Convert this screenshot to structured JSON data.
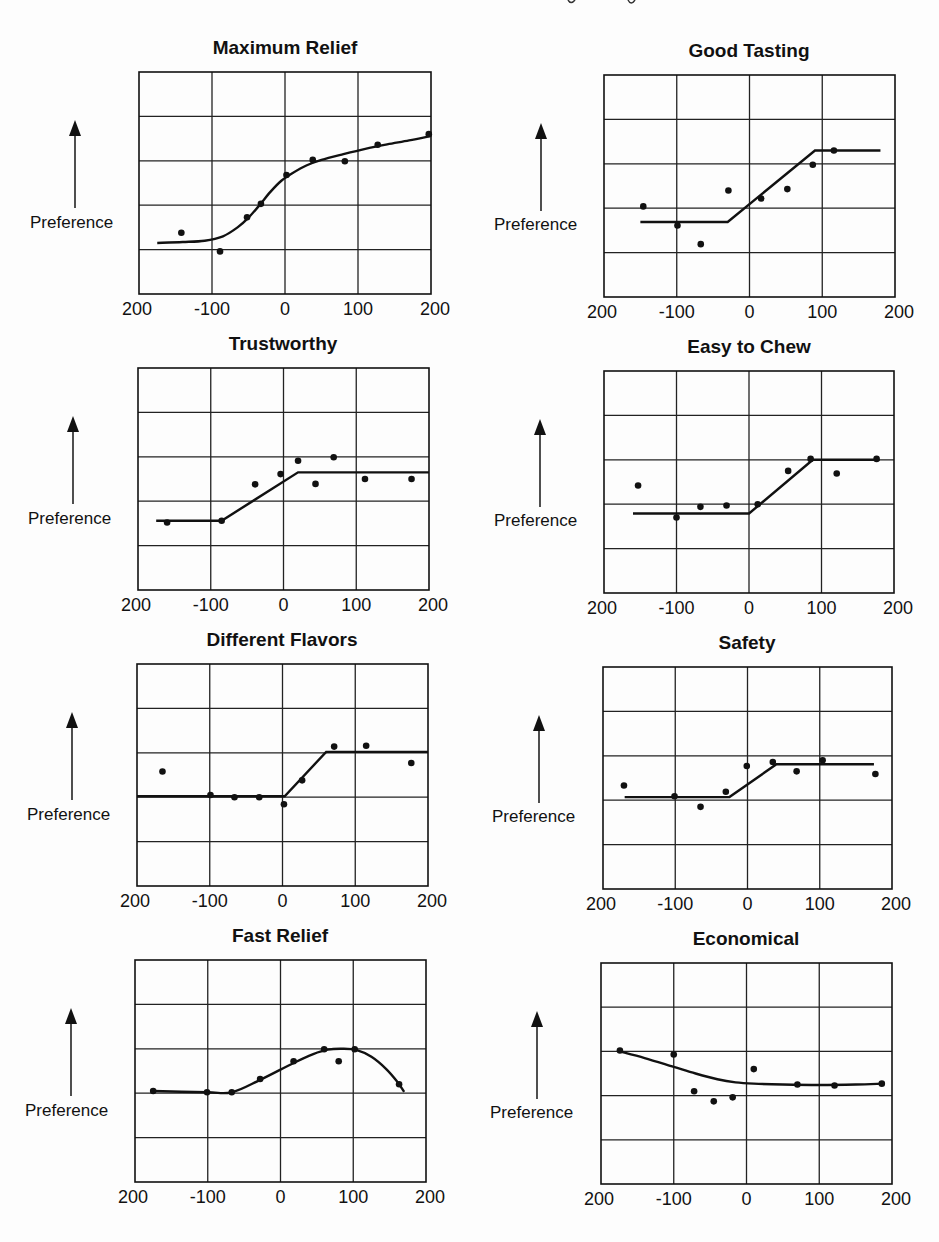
{
  "figure": {
    "y_axis_label": "Preference",
    "x_tick_labels": [
      "200",
      "-100",
      "0",
      "100",
      "200"
    ]
  },
  "chart_data": [
    {
      "type": "scatter",
      "title": "Maximum Relief",
      "xlabel": "",
      "ylabel": "Preference",
      "xlim": [
        -200,
        200
      ],
      "ylim": [
        0,
        5
      ],
      "x_ticks": [
        -200,
        -100,
        0,
        100,
        200
      ],
      "x_tick_labels": [
        "200",
        "-100",
        "0",
        "100",
        "200"
      ],
      "grid": true,
      "points": {
        "x": [
          -142,
          -89,
          -52,
          -33,
          2,
          38,
          82,
          127,
          197
        ],
        "y": [
          1.38,
          0.96,
          1.73,
          2.03,
          2.68,
          3.02,
          2.99,
          3.36,
          3.6
        ]
      },
      "fit": {
        "kind": "curve",
        "x": [
          -175,
          -140,
          -110,
          -85,
          -65,
          -50,
          -35,
          -20,
          -5,
          10,
          30,
          50,
          80,
          110,
          140,
          170,
          200
        ],
        "y": [
          1.15,
          1.17,
          1.2,
          1.3,
          1.5,
          1.72,
          2.0,
          2.3,
          2.55,
          2.72,
          2.9,
          3.02,
          3.15,
          3.27,
          3.37,
          3.46,
          3.56
        ]
      }
    },
    {
      "type": "scatter",
      "title": "Good Tasting",
      "xlabel": "",
      "ylabel": "Preference",
      "xlim": [
        -200,
        200
      ],
      "ylim": [
        0,
        5
      ],
      "x_ticks": [
        -200,
        -100,
        0,
        100,
        200
      ],
      "x_tick_labels": [
        "200",
        "-100",
        "0",
        "100",
        "200"
      ],
      "grid": true,
      "points": {
        "x": [
          -146,
          -99,
          -67,
          -29,
          16,
          52,
          87,
          116
        ],
        "y": [
          2.04,
          1.61,
          1.19,
          2.4,
          2.22,
          2.43,
          2.98,
          3.3
        ]
      },
      "fit": {
        "kind": "piecewise",
        "x": [
          -150,
          -30,
          90,
          180
        ],
        "y": [
          1.69,
          1.69,
          3.3,
          3.3
        ]
      }
    },
    {
      "type": "scatter",
      "title": "Trustworthy",
      "xlabel": "",
      "ylabel": "Preference",
      "xlim": [
        -200,
        200
      ],
      "ylim": [
        0,
        5
      ],
      "x_ticks": [
        -200,
        -100,
        0,
        100,
        200
      ],
      "x_tick_labels": [
        "200",
        "-100",
        "0",
        "100",
        "200"
      ],
      "grid": true,
      "points": {
        "x": [
          -160,
          -85,
          -39,
          -4,
          20,
          44,
          69,
          112,
          176
        ],
        "y": [
          1.52,
          1.56,
          2.38,
          2.61,
          2.91,
          2.39,
          2.99,
          2.5,
          2.5
        ]
      },
      "fit": {
        "kind": "piecewise",
        "x": [
          -175,
          -85,
          20,
          200
        ],
        "y": [
          1.56,
          1.56,
          2.65,
          2.65
        ]
      }
    },
    {
      "type": "scatter",
      "title": "Easy to Chew",
      "xlabel": "",
      "ylabel": "Preference",
      "xlim": [
        -200,
        200
      ],
      "ylim": [
        0,
        5
      ],
      "x_ticks": [
        -200,
        -100,
        0,
        100,
        200
      ],
      "x_tick_labels": [
        "200",
        "-100",
        "0",
        "100",
        "200"
      ],
      "grid": true,
      "points": {
        "x": [
          -153,
          -100,
          -67,
          -31,
          12,
          54,
          85,
          121,
          176
        ],
        "y": [
          2.42,
          1.7,
          1.94,
          1.97,
          2.0,
          2.75,
          3.02,
          2.69,
          3.02
        ]
      },
      "fit": {
        "kind": "piecewise",
        "x": [
          -160,
          0,
          88,
          180
        ],
        "y": [
          1.79,
          1.79,
          3.0,
          3.0
        ]
      }
    },
    {
      "type": "scatter",
      "title": "Different Flavors",
      "xlabel": "",
      "ylabel": "Preference",
      "xlim": [
        -200,
        200
      ],
      "ylim": [
        0,
        5
      ],
      "x_ticks": [
        -200,
        -100,
        0,
        100,
        200
      ],
      "x_tick_labels": [
        "200",
        "-100",
        "0",
        "100",
        "200"
      ],
      "grid": true,
      "points": {
        "x": [
          -165,
          -99,
          -66,
          -32,
          2,
          27,
          71,
          115,
          177
        ],
        "y": [
          2.58,
          2.05,
          2.0,
          2.0,
          1.84,
          2.38,
          3.14,
          3.16,
          2.77
        ]
      },
      "fit": {
        "kind": "piecewise",
        "x": [
          -200,
          3,
          60,
          200
        ],
        "y": [
          2.02,
          2.02,
          3.02,
          3.02
        ]
      }
    },
    {
      "type": "scatter",
      "title": "Safety",
      "xlabel": "",
      "ylabel": "Preference",
      "xlim": [
        -200,
        200
      ],
      "ylim": [
        0,
        5
      ],
      "x_ticks": [
        -200,
        -100,
        0,
        100,
        200
      ],
      "x_tick_labels": [
        "200",
        "-100",
        "0",
        "100",
        "200"
      ],
      "grid": true,
      "points": {
        "x": [
          -171,
          -101,
          -65,
          -30,
          -1,
          35,
          68,
          104,
          177
        ],
        "y": [
          2.33,
          2.09,
          1.85,
          2.19,
          2.77,
          2.86,
          2.65,
          2.9,
          2.59
        ]
      },
      "fit": {
        "kind": "piecewise",
        "x": [
          -170,
          -25,
          40,
          175
        ],
        "y": [
          2.07,
          2.07,
          2.81,
          2.81
        ]
      }
    },
    {
      "type": "scatter",
      "title": "Fast Relief",
      "xlabel": "",
      "ylabel": "Preference",
      "xlim": [
        -200,
        200
      ],
      "ylim": [
        0,
        5
      ],
      "x_ticks": [
        -200,
        -100,
        0,
        100,
        200
      ],
      "x_tick_labels": [
        "200",
        "-100",
        "0",
        "100",
        "200"
      ],
      "grid": true,
      "points": {
        "x": [
          -175,
          -101,
          -67,
          -28,
          18,
          60,
          80,
          102,
          163
        ],
        "y": [
          2.05,
          2.02,
          2.02,
          2.32,
          2.72,
          2.99,
          2.72,
          2.99,
          2.2
        ]
      },
      "fit": {
        "kind": "curve",
        "x": [
          -175,
          -101,
          -67,
          -28,
          18,
          45,
          65,
          85,
          105,
          125,
          145,
          160,
          170
        ],
        "y": [
          2.05,
          2.02,
          2.02,
          2.3,
          2.68,
          2.88,
          2.98,
          3.0,
          2.97,
          2.82,
          2.55,
          2.27,
          2.03
        ]
      }
    },
    {
      "type": "scatter",
      "title": "Economical",
      "xlabel": "",
      "ylabel": "Preference",
      "xlim": [
        -200,
        200
      ],
      "ylim": [
        0,
        5
      ],
      "x_ticks": [
        -200,
        -100,
        0,
        100,
        200
      ],
      "x_tick_labels": [
        "200",
        "-100",
        "0",
        "100",
        "200"
      ],
      "grid": true,
      "points": {
        "x": [
          -174,
          -100,
          -72,
          -45,
          -19,
          10,
          70,
          121,
          186
        ],
        "y": [
          3.02,
          2.93,
          2.1,
          1.87,
          1.96,
          2.6,
          2.25,
          2.23,
          2.27
        ]
      },
      "fit": {
        "kind": "curve",
        "x": [
          -174,
          -140,
          -100,
          -70,
          -40,
          -15,
          10,
          50,
          100,
          150,
          186
        ],
        "y": [
          3.0,
          2.85,
          2.65,
          2.5,
          2.37,
          2.3,
          2.27,
          2.25,
          2.24,
          2.25,
          2.27
        ]
      }
    }
  ],
  "layout_panels": [
    {
      "frame": [
        139,
        72,
        292,
        222
      ],
      "title_xy": [
        285,
        48
      ],
      "arrow_x": 75,
      "pref_xy": [
        30,
        213
      ]
    },
    {
      "frame": [
        604,
        75,
        291,
        222
      ],
      "title_xy": [
        749,
        51
      ],
      "arrow_x": 541,
      "pref_xy": [
        494,
        215
      ]
    },
    {
      "frame": [
        138,
        368,
        291,
        222
      ],
      "title_xy": [
        283,
        344
      ],
      "arrow_x": 73,
      "pref_xy": [
        28,
        509
      ]
    },
    {
      "frame": [
        604,
        371,
        290,
        222
      ],
      "title_xy": [
        749,
        347
      ],
      "arrow_x": 540,
      "pref_xy": [
        494,
        511
      ]
    },
    {
      "frame": [
        137,
        664,
        291,
        222
      ],
      "title_xy": [
        282,
        640
      ],
      "arrow_x": 72,
      "pref_xy": [
        27,
        805
      ]
    },
    {
      "frame": [
        603,
        667,
        289,
        222
      ],
      "title_xy": [
        747,
        643
      ],
      "arrow_x": 539,
      "pref_xy": [
        492,
        807
      ]
    },
    {
      "frame": [
        135,
        960,
        291,
        222
      ],
      "title_xy": [
        280,
        936
      ],
      "arrow_x": 71,
      "pref_xy": [
        25,
        1101
      ]
    },
    {
      "frame": [
        601,
        963,
        291,
        221
      ],
      "title_xy": [
        746,
        939
      ],
      "arrow_x": 537,
      "pref_xy": [
        490,
        1103
      ]
    }
  ]
}
